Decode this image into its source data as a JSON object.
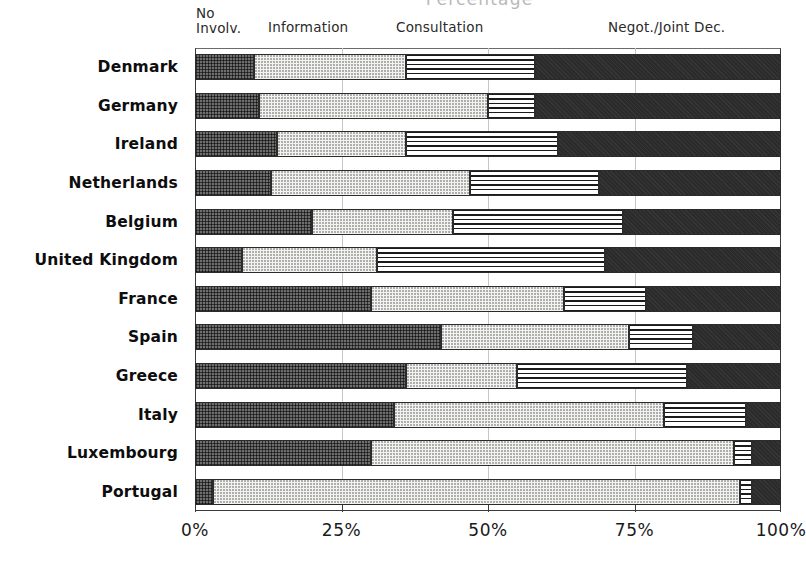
{
  "chart": {
    "title": "Percentage",
    "xlabel": "",
    "ylabel": "",
    "xticks": [
      "0%",
      "25%",
      "50%",
      "75%",
      "100%"
    ],
    "category_headers": [
      {
        "label": "No\nInvolv."
      },
      {
        "label": "Information"
      },
      {
        "label": "Consultation"
      },
      {
        "label": "Negot./Joint Dec."
      }
    ]
  },
  "chart_data": {
    "type": "bar",
    "orientation": "horizontal",
    "stacked": true,
    "title": "Percentage",
    "xlabel": "",
    "ylabel": "",
    "xlim": [
      0,
      100
    ],
    "xticks": [
      0,
      25,
      50,
      75,
      100
    ],
    "tick_labels": [
      "0%",
      "25%",
      "50%",
      "75%",
      "100%"
    ],
    "grid": true,
    "legend_position": "top",
    "categories": [
      "Denmark",
      "Germany",
      "Ireland",
      "Netherlands",
      "Belgium",
      "United Kingdom",
      "France",
      "Spain",
      "Greece",
      "Italy",
      "Luxembourg",
      "Portugal"
    ],
    "series": [
      {
        "name": "No Involv.",
        "values": [
          10,
          11,
          14,
          13,
          20,
          8,
          30,
          42,
          36,
          34,
          30,
          3
        ]
      },
      {
        "name": "Information",
        "values": [
          26,
          39,
          22,
          34,
          24,
          23,
          33,
          32,
          19,
          46,
          62,
          90
        ]
      },
      {
        "name": "Consultation",
        "values": [
          22,
          8,
          26,
          22,
          29,
          39,
          14,
          11,
          29,
          14,
          3,
          2
        ]
      },
      {
        "name": "Negot./Joint Dec.",
        "values": [
          42,
          42,
          38,
          31,
          27,
          30,
          23,
          15,
          16,
          6,
          5,
          5
        ]
      }
    ]
  }
}
